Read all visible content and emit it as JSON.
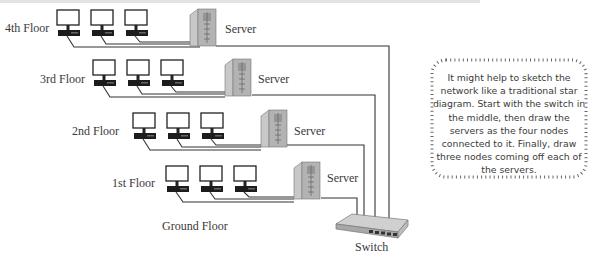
{
  "diagram": {
    "floors": [
      {
        "label": "4th Floor",
        "server_label": "Server",
        "workstations": 3
      },
      {
        "label": "3rd Floor",
        "server_label": "Server",
        "workstations": 3
      },
      {
        "label": "2nd Floor",
        "server_label": "Server",
        "workstations": 3
      },
      {
        "label": "1st Floor",
        "server_label": "Server",
        "workstations": 3
      }
    ],
    "ground_floor_label": "Ground Floor",
    "switch_label": "Switch",
    "icons": {
      "workstation": "monitor-with-desktop-icon",
      "server": "tower-server-icon",
      "switch": "network-switch-icon"
    }
  },
  "note": {
    "text": "It might help to sketch the network like a traditional star diagram. Start with the switch in the middle, then draw the servers as the four nodes connected to it. Finally, draw three nodes coming off each of the servers."
  },
  "colors": {
    "line": "#333333",
    "server": "#b0b0b0",
    "monitor_base": "#1a1a1a"
  }
}
